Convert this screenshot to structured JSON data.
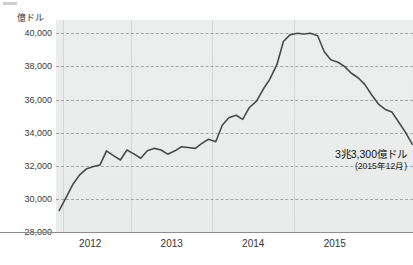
{
  "chart_data": {
    "type": "line",
    "title": "",
    "subtitle": "",
    "xlabel": "",
    "ylabel": "億ドル",
    "unit_label": "億ドル",
    "ylim": [
      28000,
      40800
    ],
    "xlim": [
      2011.58,
      2015.96
    ],
    "yticks": [
      28000,
      30000,
      32000,
      34000,
      36000,
      38000,
      40000
    ],
    "ytick_labels": [
      "28,000",
      "30,000",
      "32,000",
      "34,000",
      "36,000",
      "38,000",
      "40,000"
    ],
    "xticks": [
      2012,
      2013,
      2014,
      2015
    ],
    "xtick_labels": [
      "2012",
      "2013",
      "2014",
      "2015"
    ],
    "x_gridlines": [
      2011.66,
      2012.5,
      2013.5,
      2014.5
    ],
    "grid": true,
    "grid_style": "dashed-horizontal-solid-vertical",
    "legend": "none",
    "line_color": "#4a4a4a",
    "plot_background": "#ececec",
    "page_background": "#ffffff",
    "series": [
      {
        "name": "外貨準備高",
        "x": [
          2011.62,
          2011.7,
          2011.79,
          2011.87,
          2011.95,
          2012.04,
          2012.12,
          2012.2,
          2012.29,
          2012.37,
          2012.45,
          2012.54,
          2012.62,
          2012.7,
          2012.79,
          2012.87,
          2012.95,
          2013.04,
          2013.12,
          2013.2,
          2013.29,
          2013.37,
          2013.45,
          2013.54,
          2013.62,
          2013.7,
          2013.79,
          2013.87,
          2013.95,
          2014.04,
          2014.12,
          2014.2,
          2014.29,
          2014.37,
          2014.45,
          2014.54,
          2014.62,
          2014.7,
          2014.79,
          2014.87,
          2014.95,
          2015.04,
          2015.12,
          2015.2,
          2015.29,
          2015.37,
          2015.45,
          2015.54,
          2015.62,
          2015.7,
          2015.79,
          2015.87,
          2015.95
        ],
        "values": [
          29300,
          30050,
          30900,
          31450,
          31800,
          31950,
          32050,
          32900,
          32600,
          32350,
          32950,
          32700,
          32450,
          32900,
          33050,
          32950,
          32700,
          32900,
          33150,
          33100,
          33050,
          33350,
          33600,
          33450,
          34450,
          34900,
          35050,
          34800,
          35500,
          35900,
          36600,
          37200,
          38100,
          39500,
          39900,
          40000,
          39950,
          40000,
          39850,
          38900,
          38400,
          38250,
          38000,
          37600,
          37300,
          36900,
          36300,
          35700,
          35400,
          35250,
          34600,
          34000,
          33300
        ]
      }
    ],
    "annotations": [
      {
        "text": "3兆3,300億ドル",
        "sub_text": "(2015年12月)",
        "x": 2015.9,
        "y": 33300
      }
    ]
  }
}
